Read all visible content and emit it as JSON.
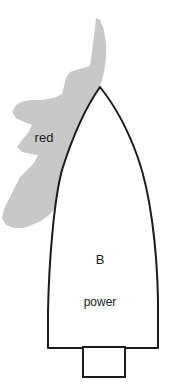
{
  "figure": {
    "background_color": "#ffffff",
    "width": 170,
    "height": 390
  },
  "colors": {
    "sector_fill": "#c8c8c8",
    "outline": "#1a1a1a",
    "hull_fill": "#ffffff",
    "label_color": "#1a1a1a"
  },
  "labels": {
    "sector": "red",
    "vessel": "B",
    "propulsion": "power"
  },
  "shapes": {
    "sector": {
      "name": "red-sector",
      "fill": "#c8c8c8",
      "stroke": "none",
      "description": "jagged lobed gray region off the port bow"
    },
    "hull": {
      "name": "boat-hull",
      "fill": "#ffffff",
      "stroke": "#1a1a1a",
      "stroke_width": 2,
      "description": "pointed bow at top, curved sides, flat transom at bottom"
    },
    "motor": {
      "name": "outboard-motor-box",
      "fill": "#ffffff",
      "stroke": "#1a1a1a",
      "stroke_width": 2,
      "description": "rectangle centered on transom"
    }
  },
  "geometry": {
    "sector_path": "M 96,18 L 94,36 L 92,52 L 90,66 L 83,68 L 76,70 L 70,72 L 66,78 L 64,86 L 62,94 L 56,97 L 48,99 L 40,100 L 32,100 L 24,101 L 16,105 L 12,112 L 16,118 L 24,122 L 32,125 L 28,133 L 22,140 L 17,147 L 22,152 L 30,154 L 38,155 L 34,163 L 27,170 L 20,177 L 16,185 L 12,193 L 8,201 L 4,209 L 2,218 L 6,225 L 14,228 L 23,228 L 32,225 L 41,221 L 49,215 L 56,207 L 61,197 L 64,186 L 66,175 L 69,164 L 73,153 L 78,143 L 83,133 L 88,123 L 93,113 L 97,103 L 100,93 L 100,87 L 104,73 L 106,58 L 106,44 L 104,30 L 100,20 Z",
    "hull_path": "M 100,87 C 88,104 74,132 62,170 C 54,200 49,260 48,312 L 48,348 L 158,348 L 158,300 C 157,246 150,192 138,158 C 126,124 112,102 100,87 Z",
    "motor_rect": {
      "x": 83,
      "y": 347,
      "width": 42,
      "height": 30
    },
    "label_positions": {
      "sector": {
        "x": 44,
        "y": 142
      },
      "vessel": {
        "x": 100,
        "y": 264
      },
      "propulsion": {
        "x": 100,
        "y": 306
      }
    }
  }
}
